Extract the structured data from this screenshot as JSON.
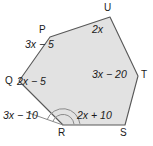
{
  "figure": {
    "type": "geometry-diagram",
    "shape_name": "hexagon PQRSTU",
    "fill_color": "#e2e2e2",
    "stroke_color": "#585858",
    "text_color": "#1a1a1a",
    "background_color": "#ffffff",
    "vertices": [
      {
        "name": "P",
        "label": "P",
        "x": 50,
        "y": 37,
        "label_x": 39,
        "label_y": 25
      },
      {
        "name": "U",
        "label": "U",
        "x": 110,
        "y": 17,
        "label_x": 104,
        "label_y": 3
      },
      {
        "name": "T",
        "label": "T",
        "x": 138,
        "y": 76,
        "label_x": 141,
        "label_y": 70
      },
      {
        "name": "S",
        "label": "S",
        "x": 125,
        "y": 125,
        "label_x": 120,
        "label_y": 128
      },
      {
        "name": "R",
        "label": "R",
        "x": 63,
        "y": 125,
        "label_x": 58,
        "label_y": 128
      },
      {
        "name": "Q",
        "label": "Q",
        "x": 19,
        "y": 81,
        "label_x": 5,
        "label_y": 76
      }
    ],
    "angle_labels": [
      {
        "at": "P",
        "text": "3x − 5",
        "x": 25,
        "y": 39
      },
      {
        "at": "U",
        "text": "2x",
        "x": 92,
        "y": 24
      },
      {
        "at": "T",
        "text": "3x − 20",
        "x": 92,
        "y": 69
      },
      {
        "at": "S",
        "text": "2x + 10",
        "x": 77,
        "y": 110
      },
      {
        "at": "Q",
        "text": "2x − 5",
        "x": 17,
        "y": 76
      },
      {
        "at": "R",
        "text": "3x − 10",
        "x": 3,
        "y": 110
      }
    ],
    "arc_marks": [
      {
        "at": "R",
        "kind": "interior-angle-arc",
        "radius": 11
      },
      {
        "at": "R",
        "kind": "exterior-angle-arc",
        "radius": 17
      }
    ]
  }
}
